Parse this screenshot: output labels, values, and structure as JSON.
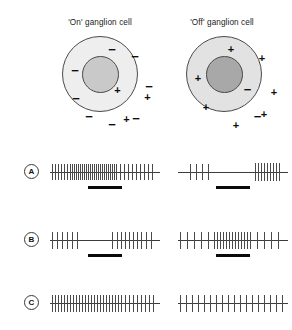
{
  "figure": {
    "columns": [
      {
        "id": "on",
        "title": "'On' ganglion cell"
      },
      {
        "id": "off",
        "title": "'Off' ganglion cell"
      }
    ],
    "receptive_fields": [
      {
        "id": "on-cell",
        "surround_sign": "−",
        "center_sign": "+",
        "surround_fill": "#eeeeee",
        "center_fill": "#c9c9c9",
        "stroke": "#4a4a4a",
        "surround_symbols": [
          "−",
          "−",
          "−",
          "−",
          "−",
          "−",
          "−",
          "−"
        ],
        "center_symbols": [
          "+",
          "+",
          "+"
        ]
      },
      {
        "id": "off-cell",
        "surround_sign": "+",
        "center_sign": "−",
        "surround_fill": "#e2e2e2",
        "center_fill": "#a8a8a8",
        "stroke": "#4a4a4a",
        "surround_symbols": [
          "+",
          "+",
          "+",
          "+",
          "+",
          "+",
          "+"
        ],
        "center_symbols": [
          "−",
          "−"
        ]
      }
    ],
    "rows": [
      {
        "label": "A",
        "stimulus_bar": {
          "present": true,
          "span": "center-spot"
        },
        "traces": [
          {
            "column": "on",
            "description": "vigorous maintained discharge throughout"
          },
          {
            "column": "off",
            "description": "sparse firing then burst at stimulus offset"
          }
        ]
      },
      {
        "label": "B",
        "stimulus_bar": {
          "present": true,
          "span": "annulus"
        },
        "traces": [
          {
            "column": "on",
            "description": "firing, silent gap during stimulus, firing resumes"
          },
          {
            "column": "off",
            "description": "low rate, dense burst during stimulus, low rate"
          }
        ]
      },
      {
        "label": "C",
        "stimulus_bar": {
          "present": false,
          "span": "none"
        },
        "traces": [
          {
            "column": "on",
            "description": "uniform maintained discharge, no response change"
          },
          {
            "column": "off",
            "description": "uniform maintained discharge, no response change"
          }
        ]
      }
    ]
  },
  "chart_data": {
    "type": "raster",
    "xlabel": "",
    "ylabel": "",
    "grid": false,
    "legend": "none",
    "panel_width": 110,
    "rows": [
      {
        "label": "A",
        "bar": {
          "x": 38,
          "width": 34
        },
        "panels": [
          {
            "column": "on",
            "spikes": [
              2,
              5,
              8,
              11,
              14,
              17,
              20,
              22,
              24,
              26,
              28,
              30,
              32,
              34,
              36,
              38,
              40,
              42,
              44,
              46,
              48,
              50,
              52,
              54,
              56,
              58,
              60,
              62,
              64,
              66,
              70,
              74,
              78,
              82,
              86,
              90,
              94,
              98,
              102
            ],
            "heights": [
              16,
              16,
              16,
              16,
              16,
              16,
              16,
              16,
              16,
              16,
              16,
              16,
              16,
              16,
              16,
              16,
              16,
              16,
              16,
              16,
              16,
              16,
              16,
              16,
              16,
              16,
              16,
              16,
              16,
              16,
              16,
              16,
              16,
              16,
              16,
              16,
              16,
              16,
              16
            ]
          },
          {
            "column": "off",
            "spikes": [
              12,
              18,
              24,
              30,
              77,
              80,
              83,
              86,
              89,
              92,
              95,
              98,
              101
            ],
            "heights": [
              16,
              16,
              16,
              16,
              18,
              18,
              18,
              18,
              18,
              18,
              18,
              18,
              18
            ]
          }
        ]
      },
      {
        "label": "B",
        "bar": {
          "x": 38,
          "width": 34
        },
        "panels": [
          {
            "column": "on",
            "spikes": [
              2,
              7,
              12,
              17,
              22,
              27,
              62,
              67,
              71,
              75,
              79,
              83,
              87,
              91,
              96,
              101
            ],
            "heights": [
              17,
              17,
              17,
              17,
              17,
              17,
              17,
              17,
              17,
              17,
              17,
              17,
              17,
              17,
              17,
              17
            ]
          },
          {
            "column": "off",
            "spikes": [
              2,
              9,
              16,
              23,
              30,
              36,
              39,
              42,
              45,
              48,
              51,
              54,
              57,
              60,
              63,
              66,
              69,
              72,
              79,
              86,
              93,
              100
            ],
            "heights": [
              17,
              17,
              17,
              17,
              17,
              17,
              17,
              17,
              17,
              17,
              17,
              17,
              17,
              17,
              17,
              17,
              17,
              17,
              17,
              17,
              17,
              17
            ]
          }
        ]
      },
      {
        "label": "C",
        "bar": null,
        "panels": [
          {
            "column": "on",
            "spikes": [
              2,
              5,
              8,
              11,
              14,
              17,
              20,
              23,
              26,
              29,
              32,
              35,
              38,
              41,
              44,
              47,
              50,
              53,
              56,
              59,
              62,
              65,
              68,
              71,
              75,
              79,
              83,
              87,
              91,
              95,
              99,
              103
            ],
            "heights": [
              17,
              17,
              17,
              17,
              17,
              17,
              17,
              17,
              17,
              17,
              17,
              17,
              17,
              17,
              17,
              17,
              17,
              17,
              17,
              17,
              17,
              17,
              17,
              17,
              17,
              17,
              17,
              17,
              17,
              17,
              17,
              17
            ]
          },
          {
            "column": "off",
            "spikes": [
              2,
              8,
              14,
              20,
              26,
              32,
              38,
              44,
              50,
              56,
              62,
              68,
              74,
              80,
              86,
              92,
              98,
              104
            ],
            "heights": [
              17,
              17,
              17,
              17,
              17,
              17,
              17,
              17,
              17,
              17,
              17,
              17,
              17,
              17,
              17,
              17,
              17,
              17
            ]
          }
        ]
      }
    ]
  }
}
